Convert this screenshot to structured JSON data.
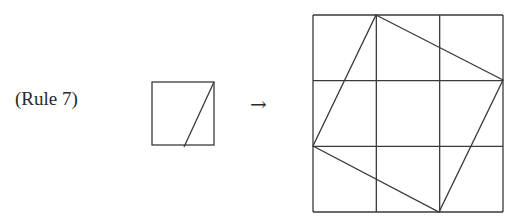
{
  "label": "(Rule 7)",
  "arrow": "→",
  "stroke_color": "#3a3a3a",
  "small_square": {
    "x": 152,
    "y": 82,
    "size": 64,
    "diagonal": {
      "x1": 214,
      "y1": 82,
      "x2": 184,
      "y2": 147
    }
  },
  "grid": {
    "x": 313,
    "y": 15,
    "width": 190,
    "height": 197,
    "rows": 3,
    "cols": 3
  },
  "tilted_square": {
    "points": [
      [
        376,
        15
      ],
      [
        503,
        80
      ],
      [
        439,
        212
      ],
      [
        313,
        146
      ]
    ]
  }
}
